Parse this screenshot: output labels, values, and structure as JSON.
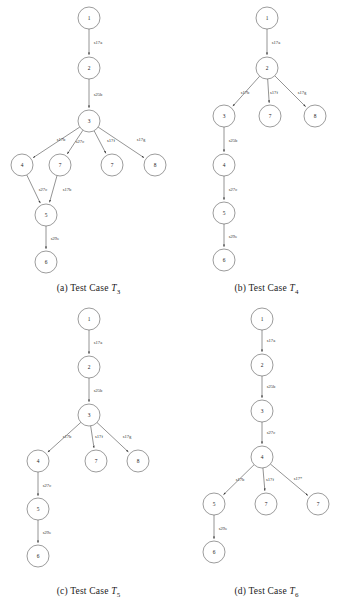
{
  "figure": {
    "panels": [
      {
        "id": "a",
        "caption_prefix": "(a) Test Case ",
        "caption_symbol": "T",
        "caption_subscript": "3",
        "nodes": [
          {
            "id": "n1",
            "label": "1",
            "x": 89,
            "y": 18
          },
          {
            "id": "n2",
            "label": "2",
            "x": 89,
            "y": 68
          },
          {
            "id": "n3",
            "label": "3",
            "x": 89,
            "y": 121
          },
          {
            "id": "n4",
            "label": "4",
            "x": 22,
            "y": 165
          },
          {
            "id": "n7a",
            "label": "7",
            "x": 60,
            "y": 165
          },
          {
            "id": "n7b",
            "label": "7",
            "x": 112,
            "y": 165
          },
          {
            "id": "n8",
            "label": "8",
            "x": 155,
            "y": 165
          },
          {
            "id": "n5",
            "label": "5",
            "x": 46,
            "y": 215
          },
          {
            "id": "n6",
            "label": "6",
            "x": 46,
            "y": 262
          }
        ],
        "edges": [
          {
            "from": "n1",
            "to": "n2",
            "label": "s17a",
            "lx": 98,
            "ly": 43
          },
          {
            "from": "n2",
            "to": "n3",
            "label": "s25b",
            "lx": 98,
            "ly": 95
          },
          {
            "from": "n3",
            "to": "n4",
            "label": "s17b",
            "lx": 61,
            "ly": 140
          },
          {
            "from": "n3",
            "to": "n7a",
            "label": "s27c",
            "lx": 80,
            "ly": 142
          },
          {
            "from": "n3",
            "to": "n7b",
            "label": "s17f",
            "lx": 111,
            "ly": 141
          },
          {
            "from": "n3",
            "to": "n8",
            "label": "s17g",
            "lx": 141,
            "ly": 140
          },
          {
            "from": "n4",
            "to": "n5",
            "label": "s27c",
            "lx": 43,
            "ly": 190
          },
          {
            "from": "n7a",
            "to": "n5",
            "label": "s17b",
            "lx": 67,
            "ly": 190
          },
          {
            "from": "n5",
            "to": "n6",
            "label": "s29e",
            "lx": 55,
            "ly": 239
          }
        ]
      },
      {
        "id": "b",
        "caption_prefix": "(b) Test Case ",
        "caption_symbol": "T",
        "caption_subscript": "4",
        "nodes": [
          {
            "id": "n1",
            "label": "1",
            "x": 89,
            "y": 18
          },
          {
            "id": "n2",
            "label": "2",
            "x": 89,
            "y": 68
          },
          {
            "id": "n3",
            "label": "3",
            "x": 46,
            "y": 116
          },
          {
            "id": "n7",
            "label": "7",
            "x": 92,
            "y": 116
          },
          {
            "id": "n8",
            "label": "8",
            "x": 137,
            "y": 116
          },
          {
            "id": "n4",
            "label": "4",
            "x": 46,
            "y": 165
          },
          {
            "id": "n5",
            "label": "5",
            "x": 46,
            "y": 213
          },
          {
            "id": "n6",
            "label": "6",
            "x": 46,
            "y": 260
          }
        ],
        "edges": [
          {
            "from": "n1",
            "to": "n2",
            "label": "s17a",
            "lx": 98,
            "ly": 43
          },
          {
            "from": "n2",
            "to": "n3",
            "label": "s17b",
            "lx": 67,
            "ly": 93
          },
          {
            "from": "n2",
            "to": "n7",
            "label": "s17f",
            "lx": 96,
            "ly": 93
          },
          {
            "from": "n2",
            "to": "n8",
            "label": "s17g",
            "lx": 124,
            "ly": 93
          },
          {
            "from": "n3",
            "to": "n4",
            "label": "s25b",
            "lx": 55,
            "ly": 141
          },
          {
            "from": "n4",
            "to": "n5",
            "label": "s27c",
            "lx": 55,
            "ly": 190
          },
          {
            "from": "n5",
            "to": "n6",
            "label": "s29e",
            "lx": 55,
            "ly": 237
          }
        ]
      },
      {
        "id": "c",
        "caption_prefix": "(c) Test Case ",
        "caption_symbol": "T",
        "caption_subscript": "5",
        "nodes": [
          {
            "id": "n1",
            "label": "1",
            "x": 89,
            "y": 16
          },
          {
            "id": "n2",
            "label": "2",
            "x": 89,
            "y": 64
          },
          {
            "id": "n3",
            "label": "3",
            "x": 89,
            "y": 112
          },
          {
            "id": "n4",
            "label": "4",
            "x": 38,
            "y": 158
          },
          {
            "id": "n7",
            "label": "7",
            "x": 96,
            "y": 158
          },
          {
            "id": "n8",
            "label": "8",
            "x": 138,
            "y": 158
          },
          {
            "id": "n5",
            "label": "5",
            "x": 38,
            "y": 206
          },
          {
            "id": "n6",
            "label": "6",
            "x": 38,
            "y": 253
          }
        ],
        "edges": [
          {
            "from": "n1",
            "to": "n2",
            "label": "s17a",
            "lx": 98,
            "ly": 40
          },
          {
            "from": "n2",
            "to": "n3",
            "label": "s25b",
            "lx": 98,
            "ly": 88
          },
          {
            "from": "n3",
            "to": "n4",
            "label": "s17b",
            "lx": 67,
            "ly": 134
          },
          {
            "from": "n3",
            "to": "n7",
            "label": "s17f",
            "lx": 99,
            "ly": 134
          },
          {
            "from": "n3",
            "to": "n8",
            "label": "s17g",
            "lx": 127,
            "ly": 134
          },
          {
            "from": "n4",
            "to": "n5",
            "label": "s27c",
            "lx": 47,
            "ly": 183
          },
          {
            "from": "n5",
            "to": "n6",
            "label": "s29e",
            "lx": 47,
            "ly": 230
          }
        ]
      },
      {
        "id": "d",
        "caption_prefix": "(d) Test Case ",
        "caption_symbol": "T",
        "caption_subscript": "6",
        "nodes": [
          {
            "id": "n1",
            "label": "1",
            "x": 84,
            "y": 16
          },
          {
            "id": "n2",
            "label": "2",
            "x": 84,
            "y": 62
          },
          {
            "id": "n3",
            "label": "3",
            "x": 84,
            "y": 108
          },
          {
            "id": "n4",
            "label": "4",
            "x": 84,
            "y": 154
          },
          {
            "id": "n5",
            "label": "5",
            "x": 36,
            "y": 201
          },
          {
            "id": "n7a",
            "label": "7",
            "x": 88,
            "y": 201
          },
          {
            "id": "n7b",
            "label": "7",
            "x": 140,
            "y": 201
          },
          {
            "id": "n6",
            "label": "6",
            "x": 36,
            "y": 249
          }
        ],
        "edges": [
          {
            "from": "n1",
            "to": "n2",
            "label": "s17a",
            "lx": 93,
            "ly": 38
          },
          {
            "from": "n2",
            "to": "n3",
            "label": "s25b",
            "lx": 93,
            "ly": 84
          },
          {
            "from": "n3",
            "to": "n4",
            "label": "s27c",
            "lx": 93,
            "ly": 130
          },
          {
            "from": "n4",
            "to": "n5",
            "label": "s17b",
            "lx": 62,
            "ly": 177
          },
          {
            "from": "n4",
            "to": "n7a",
            "label": "s17f",
            "lx": 92,
            "ly": 177
          },
          {
            "from": "n4",
            "to": "n7b",
            "label": "s17*",
            "lx": 120,
            "ly": 176
          },
          {
            "from": "n5",
            "to": "n6",
            "label": "s29e",
            "lx": 45,
            "ly": 226
          }
        ]
      }
    ],
    "style": {
      "node_radius": 11,
      "node_stroke": "#4a4a4a",
      "edge_stroke": "#3a3a3a",
      "background": "#ffffff"
    }
  }
}
